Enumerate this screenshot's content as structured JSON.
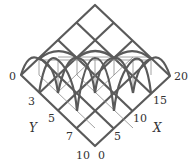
{
  "figure": {
    "type": "3d-surface-wireframe",
    "colors": {
      "thick_line": "#5a5a5a",
      "thin_line": "#7a7a7a",
      "text": "#333333",
      "background": "#ffffff"
    }
  },
  "axes": {
    "y": {
      "title": "Y",
      "ticks": [
        {
          "label": "0"
        },
        {
          "label": "3"
        },
        {
          "label": "5"
        },
        {
          "label": "7"
        },
        {
          "label": "10"
        }
      ]
    },
    "x": {
      "title": "X",
      "ticks": [
        {
          "label": "0"
        },
        {
          "label": "5"
        },
        {
          "label": "10"
        },
        {
          "label": "15"
        },
        {
          "label": "20"
        }
      ]
    }
  }
}
